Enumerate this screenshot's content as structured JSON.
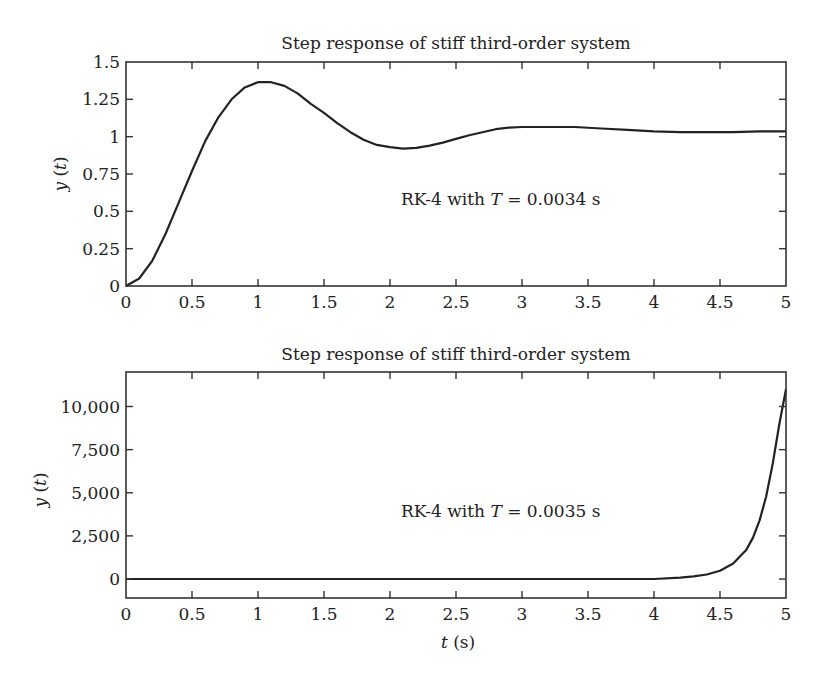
{
  "figure": {
    "panels": [
      {
        "title": "Step response of stiff third-order system",
        "ylabel": "y (t)",
        "ylabel_var": "y",
        "ylabel_arg": "t",
        "annotation_prefix": "RK-4 with ",
        "annotation_var": "T",
        "annotation_suffix": " = 0.0034 s",
        "xticks": [
          "0",
          "0.5",
          "1",
          "1.5",
          "2",
          "2.5",
          "3",
          "3.5",
          "4",
          "4.5",
          "5"
        ],
        "yticks": [
          "0",
          "0.25",
          "0.5",
          "0.75",
          "1",
          "1.25",
          "1.5"
        ]
      },
      {
        "title": "Step response of stiff third-order system",
        "ylabel": "y (t)",
        "ylabel_var": "y",
        "ylabel_arg": "t",
        "annotation_prefix": "RK-4 with ",
        "annotation_var": "T",
        "annotation_suffix": " = 0.0035 s",
        "xticks": [
          "0",
          "0.5",
          "1",
          "1.5",
          "2",
          "2.5",
          "3",
          "3.5",
          "4",
          "4.5",
          "5"
        ],
        "yticks": [
          "0",
          "2,500",
          "5,000",
          "7,500",
          "10,000"
        ],
        "xlabel": "t (s)",
        "xlabel_var": "t",
        "xlabel_unit": "(s)"
      }
    ]
  },
  "chart_data": [
    {
      "type": "line",
      "title": "Step response of stiff third-order system",
      "xlabel": "",
      "ylabel": "y(t)",
      "annotation": "RK-4 with T = 0.0034 s",
      "xlim": [
        0,
        5
      ],
      "ylim": [
        0,
        1.5
      ],
      "xticks": [
        0,
        0.5,
        1,
        1.5,
        2,
        2.5,
        3,
        3.5,
        4,
        4.5,
        5
      ],
      "yticks": [
        0,
        0.25,
        0.5,
        0.75,
        1,
        1.25,
        1.5
      ],
      "grid": false,
      "legend": null,
      "series": [
        {
          "name": "y(t)",
          "color": "#222222",
          "x": [
            0,
            0.1,
            0.2,
            0.3,
            0.4,
            0.5,
            0.6,
            0.7,
            0.8,
            0.9,
            1.0,
            1.1,
            1.2,
            1.3,
            1.4,
            1.5,
            1.6,
            1.7,
            1.8,
            1.9,
            2.0,
            2.1,
            2.2,
            2.3,
            2.4,
            2.5,
            2.6,
            2.7,
            2.8,
            2.9,
            3.0,
            3.2,
            3.4,
            3.6,
            3.8,
            4.0,
            4.2,
            4.4,
            4.6,
            4.8,
            5.0
          ],
          "y": [
            0,
            0.05,
            0.17,
            0.35,
            0.56,
            0.77,
            0.97,
            1.13,
            1.25,
            1.33,
            1.365,
            1.365,
            1.34,
            1.29,
            1.22,
            1.16,
            1.09,
            1.03,
            0.98,
            0.945,
            0.93,
            0.92,
            0.925,
            0.94,
            0.96,
            0.985,
            1.01,
            1.03,
            1.05,
            1.06,
            1.065,
            1.065,
            1.065,
            1.055,
            1.045,
            1.035,
            1.03,
            1.03,
            1.03,
            1.035,
            1.035
          ]
        }
      ]
    },
    {
      "type": "line",
      "title": "Step response of stiff third-order system",
      "xlabel": "t (s)",
      "ylabel": "y(t)",
      "annotation": "RK-4 with T = 0.0035 s",
      "xlim": [
        0,
        5
      ],
      "ylim": [
        -1100,
        12000
      ],
      "xticks": [
        0,
        0.5,
        1,
        1.5,
        2,
        2.5,
        3,
        3.5,
        4,
        4.5,
        5
      ],
      "yticks": [
        0,
        2500,
        5000,
        7500,
        10000
      ],
      "grid": false,
      "legend": null,
      "series": [
        {
          "name": "y(t)",
          "color": "#222222",
          "x": [
            0,
            1,
            2,
            3,
            4,
            4.2,
            4.3,
            4.4,
            4.5,
            4.6,
            4.7,
            4.75,
            4.8,
            4.85,
            4.9,
            4.95,
            5.0
          ],
          "y": [
            0,
            0,
            0,
            0,
            0,
            80,
            150,
            260,
            480,
            900,
            1700,
            2400,
            3400,
            4800,
            6700,
            9000,
            11000
          ]
        }
      ]
    }
  ]
}
